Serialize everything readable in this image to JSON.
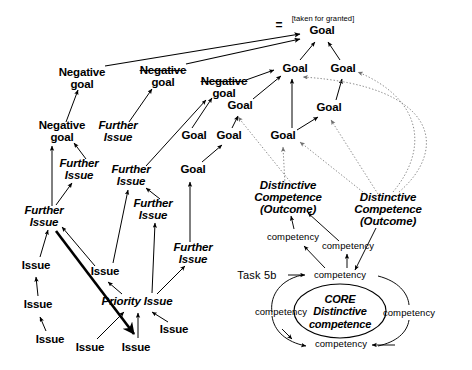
{
  "diagram": {
    "width": 472,
    "height": 370,
    "background": "#ffffff",
    "ink": "#000000",
    "dotted_ink": "#8c8c8c"
  },
  "annotations": {
    "taken_for_granted": "[taken for granted]",
    "equals_mark": "=",
    "task_label": "Task 5b"
  },
  "nodes": [
    {
      "id": "goal-top",
      "label": "Goal",
      "x": 322,
      "y": 31,
      "style": "bold"
    },
    {
      "id": "goal-r1a",
      "label": "Goal",
      "x": 295,
      "y": 69,
      "style": "bold"
    },
    {
      "id": "goal-r1b",
      "label": "Goal",
      "x": 343,
      "y": 69,
      "style": "bold"
    },
    {
      "id": "goal-mid-upper",
      "label": "Goal",
      "x": 240,
      "y": 106,
      "style": "bold"
    },
    {
      "id": "goal-right-mid",
      "label": "Goal",
      "x": 329,
      "y": 108,
      "style": "bold"
    },
    {
      "id": "goal-l1",
      "label": "Goal",
      "x": 194,
      "y": 136,
      "style": "bold"
    },
    {
      "id": "goal-l2",
      "label": "Goal",
      "x": 229,
      "y": 136,
      "style": "bold"
    },
    {
      "id": "goal-l3",
      "label": "Goal",
      "x": 283,
      "y": 136,
      "style": "bold"
    },
    {
      "id": "goal-low",
      "label": "Goal",
      "x": 193,
      "y": 170,
      "style": "bold"
    },
    {
      "id": "neg-goal-1",
      "label": "Negative\ngoal",
      "x": 82,
      "y": 79,
      "style": "bold"
    },
    {
      "id": "neg-goal-2",
      "label": "Negative\ngoal",
      "x": 163,
      "y": 77,
      "style": "bold",
      "strike_first_line": true
    },
    {
      "id": "neg-goal-3",
      "label": "Negative\ngoal",
      "x": 224,
      "y": 88,
      "style": "bold",
      "strike_first_line": true
    },
    {
      "id": "neg-goal-4",
      "label": "Negative\ngoal",
      "x": 62,
      "y": 132,
      "style": "bold"
    },
    {
      "id": "further-issue-1",
      "label": "Further\nIssue",
      "x": 118,
      "y": 132,
      "style": "bolditalic"
    },
    {
      "id": "further-issue-2",
      "label": "Further\nIssue",
      "x": 79,
      "y": 170,
      "style": "bolditalic"
    },
    {
      "id": "further-issue-3",
      "label": "Further\nIssue",
      "x": 131,
      "y": 176,
      "style": "bolditalic"
    },
    {
      "id": "further-issue-4",
      "label": "Further\nIssue",
      "x": 153,
      "y": 210,
      "style": "bolditalic"
    },
    {
      "id": "further-issue-5",
      "label": "Further\nIssue",
      "x": 44,
      "y": 217,
      "style": "bolditalic"
    },
    {
      "id": "further-issue-6",
      "label": "Further\nIssue",
      "x": 193,
      "y": 254,
      "style": "bolditalic"
    },
    {
      "id": "issue-1",
      "label": "Issue",
      "x": 36,
      "y": 266,
      "style": "bold"
    },
    {
      "id": "issue-2",
      "label": "Issue",
      "x": 38,
      "y": 305,
      "style": "bold"
    },
    {
      "id": "issue-3",
      "label": "Issue",
      "x": 50,
      "y": 340,
      "style": "bold"
    },
    {
      "id": "issue-4",
      "label": "Issue",
      "x": 105,
      "y": 272,
      "style": "bold"
    },
    {
      "id": "issue-5",
      "label": "Issue",
      "x": 90,
      "y": 348,
      "style": "bold"
    },
    {
      "id": "issue-6",
      "label": "Issue",
      "x": 136,
      "y": 348,
      "style": "bold"
    },
    {
      "id": "issue-7",
      "label": "Issue",
      "x": 174,
      "y": 330,
      "style": "bold"
    },
    {
      "id": "priority-issue",
      "label": "Priority Issue",
      "x": 137,
      "y": 302,
      "style": "bolditalic"
    },
    {
      "id": "dc-outcome-1",
      "label": "Distinctive\nCompetence\n(Outcome)",
      "x": 288,
      "y": 198,
      "style": "bolditalic"
    },
    {
      "id": "dc-outcome-2",
      "label": "Distinctive\nCompetence\n(Outcome)",
      "x": 388,
      "y": 210,
      "style": "bolditalic"
    },
    {
      "id": "core-dc",
      "label": "CORE\nDistinctive\ncompetence",
      "x": 340,
      "y": 311,
      "style": "core"
    },
    {
      "id": "competency-a",
      "label": "competency",
      "x": 293,
      "y": 237,
      "style": "light"
    },
    {
      "id": "competency-b",
      "label": "competency",
      "x": 348,
      "y": 246,
      "style": "light"
    },
    {
      "id": "competency-top",
      "label": "competency",
      "x": 340,
      "y": 275,
      "style": "light"
    },
    {
      "id": "competency-left",
      "label": "competency",
      "x": 281,
      "y": 312,
      "style": "light"
    },
    {
      "id": "competency-right",
      "label": "competency",
      "x": 409,
      "y": 313,
      "style": "light"
    },
    {
      "id": "competency-bot",
      "label": "competency",
      "x": 341,
      "y": 344,
      "style": "light"
    }
  ],
  "edges": [
    {
      "from": "neg-goal-1",
      "to": "goal-top",
      "kind": "solid-long"
    },
    {
      "from": "neg-goal-2",
      "to": "goal-top",
      "kind": "solid-long"
    },
    {
      "from": "goal-r1a",
      "to": "goal-top",
      "kind": "solid"
    },
    {
      "from": "goal-r1b",
      "to": "goal-top",
      "kind": "solid"
    },
    {
      "from": "neg-goal-3",
      "to": "goal-r1a",
      "kind": "solid"
    },
    {
      "from": "goal-mid-upper",
      "to": "goal-r1a",
      "kind": "solid"
    },
    {
      "from": "goal-l3",
      "to": "goal-r1a",
      "kind": "solid"
    },
    {
      "from": "goal-right-mid",
      "to": "goal-r1b",
      "kind": "solid"
    },
    {
      "from": "goal-l1",
      "to": "neg-goal-3",
      "kind": "solid"
    },
    {
      "from": "goal-l2",
      "to": "goal-mid-upper",
      "kind": "solid"
    },
    {
      "from": "goal-low",
      "to": "goal-l2",
      "kind": "solid"
    },
    {
      "from": "goal-l3",
      "to": "goal-right-mid",
      "kind": "solid"
    },
    {
      "from": "further-issue-1",
      "to": "neg-goal-2",
      "kind": "solid"
    },
    {
      "from": "neg-goal-4",
      "to": "neg-goal-1",
      "kind": "solid"
    },
    {
      "from": "further-issue-2",
      "to": "neg-goal-4",
      "kind": "solid"
    },
    {
      "from": "further-issue-5",
      "to": "neg-goal-4",
      "kind": "solid-vertical"
    },
    {
      "from": "further-issue-5",
      "to": "further-issue-2",
      "kind": "solid"
    },
    {
      "from": "further-issue-3",
      "to": "neg-goal-3",
      "kind": "solid"
    },
    {
      "from": "further-issue-4",
      "to": "further-issue-3",
      "kind": "solid"
    },
    {
      "from": "further-issue-6",
      "to": "goal-low",
      "kind": "solid"
    },
    {
      "from": "issue-1",
      "to": "further-issue-5",
      "kind": "solid"
    },
    {
      "from": "issue-2",
      "to": "issue-1",
      "kind": "solid"
    },
    {
      "from": "issue-3",
      "to": "issue-2",
      "kind": "solid"
    },
    {
      "from": "issue-4",
      "to": "further-issue-3",
      "kind": "solid"
    },
    {
      "from": "priority-issue",
      "to": "issue-4",
      "kind": "solid"
    },
    {
      "from": "priority-issue",
      "to": "further-issue-4",
      "kind": "solid"
    },
    {
      "from": "priority-issue",
      "to": "further-issue-6",
      "kind": "solid"
    },
    {
      "from": "issue-5",
      "to": "priority-issue",
      "kind": "solid"
    },
    {
      "from": "issue-6",
      "to": "priority-issue",
      "kind": "solid"
    },
    {
      "from": "issue-7",
      "to": "priority-issue",
      "kind": "solid"
    },
    {
      "from": "further-issue-5",
      "to": "issue-6",
      "kind": "thick"
    },
    {
      "from": "issue-4",
      "to": "further-issue-5",
      "kind": "solid"
    },
    {
      "from": "dc-outcome-1",
      "to": "goal-l3",
      "kind": "dotted"
    },
    {
      "from": "dc-outcome-1",
      "to": "goal-mid-upper",
      "kind": "dotted"
    },
    {
      "from": "dc-outcome-2",
      "to": "goal-right-mid",
      "kind": "dotted"
    },
    {
      "from": "dc-outcome-2",
      "to": "goal-r1b",
      "kind": "dotted-curve"
    },
    {
      "from": "dc-outcome-2",
      "to": "goal-r1a",
      "kind": "dotted-curve"
    },
    {
      "from": "dc-outcome-2",
      "to": "goal-l3",
      "kind": "dotted"
    },
    {
      "from": "competency-a",
      "to": "dc-outcome-1",
      "kind": "solid"
    },
    {
      "from": "competency-b",
      "to": "dc-outcome-1",
      "kind": "solid"
    },
    {
      "from": "competency-top",
      "to": "competency-b",
      "kind": "solid"
    },
    {
      "from": "competency-top",
      "to": "competency-a",
      "kind": "solid"
    },
    {
      "from": "core-dc",
      "to": "dc-outcome-2",
      "kind": "solid-curve"
    },
    {
      "from": "dc-outcome-2",
      "to": "core-dc",
      "kind": "solid-curve"
    }
  ]
}
